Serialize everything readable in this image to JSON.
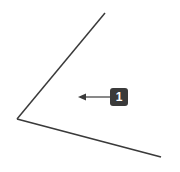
{
  "diagram": {
    "type": "angle",
    "vertex": [
      17,
      119
    ],
    "ray_upper_end": [
      105,
      13
    ],
    "ray_lower_end": [
      161,
      157
    ],
    "line_color": "#3a3a3a",
    "callout": {
      "label": "1",
      "box_color": "#3a3a3a",
      "text_color": "#ffffff",
      "arrow_from": [
        110,
        97
      ],
      "arrow_to": [
        79,
        97
      ]
    }
  }
}
